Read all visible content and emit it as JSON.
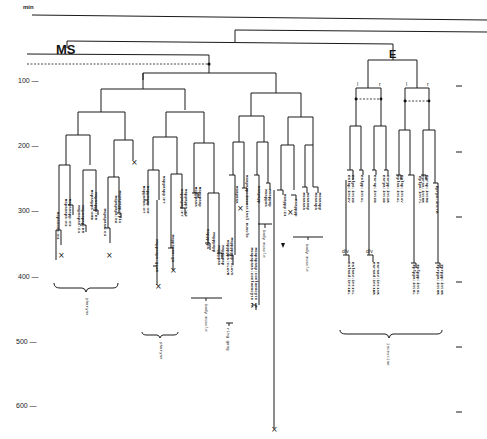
{
  "diagram": {
    "type": "cell-lineage-tree",
    "axis": {
      "unit_label": "min",
      "ticks": [
        {
          "t": 100,
          "label": "100 —"
        },
        {
          "t": 200,
          "label": "200 —"
        },
        {
          "t": 300,
          "label": "300 —"
        },
        {
          "t": 400,
          "label": "400 —"
        },
        {
          "t": 500,
          "label": "500 —"
        },
        {
          "t": 600,
          "label": "600 —"
        }
      ],
      "right_ticks": [
        100,
        200,
        300,
        400,
        500,
        600
      ]
    },
    "lineages": [
      {
        "id": "MS",
        "label": "MS"
      },
      {
        "id": "E",
        "label": "E"
      }
    ],
    "side_labels": [
      "l",
      "r",
      "l",
      "r"
    ],
    "div_labels": [
      "d/v",
      "d/v"
    ],
    "tissue_groups": [
      {
        "name": "pharynx",
        "label": "pharynx"
      },
      {
        "name": "pharynx",
        "label": "pharynx"
      },
      {
        "name": "body muscle",
        "label": "body muscle"
      },
      {
        "name": "ring gang",
        "label": "ring gang"
      },
      {
        "name": "body muscle",
        "label": "body muscle"
      },
      {
        "name": "body muscle",
        "label": "body muscle"
      },
      {
        "name": "intestine",
        "label": "intestine"
      }
    ],
    "cell_labels": [
      {
        "x": 57,
        "t": 345,
        "text": "MSpaaaaa:m4"
      },
      {
        "x": 65,
        "t": 325,
        "text": "MSpaaapa:m3"
      },
      {
        "x": 69,
        "t": 325,
        "text": "MSpaaapp:m3"
      },
      {
        "x": 78,
        "t": 335,
        "text": "MSpaapaa:I4"
      },
      {
        "x": 82,
        "t": 335,
        "text": "MSpaapap:m5"
      },
      {
        "x": 91,
        "t": 315,
        "text": "MSpaappa:m5D"
      },
      {
        "x": 95,
        "t": 315,
        "text": "MSpaappp:m5"
      },
      {
        "x": 104,
        "t": 340,
        "text": "MSpapaaa:e3"
      },
      {
        "x": 115,
        "t": 320,
        "text": "MSpapapa:m2"
      },
      {
        "x": 119,
        "t": 320,
        "text": "MSpapapp:vpi1"
      },
      {
        "x": 143,
        "t": 305,
        "text": "MSppaaaa:m7"
      },
      {
        "x": 147,
        "t": 305,
        "text": "MSppaaap:m6"
      },
      {
        "x": 156,
        "t": 395,
        "text": "MSppaapa:g1AR"
      },
      {
        "x": 163,
        "t": 290,
        "text": "MSppaapp:m7"
      },
      {
        "x": 172,
        "t": 380,
        "text": "MSppapaa:g2"
      },
      {
        "x": 181,
        "t": 310,
        "text": "MSppapap:m7"
      },
      {
        "x": 185,
        "t": 310,
        "text": "MSppappa:m2"
      },
      {
        "x": 195,
        "t": 295,
        "text": "MSpppaaa"
      },
      {
        "x": 199,
        "t": 295,
        "text": "MSpppaap"
      },
      {
        "x": 207,
        "t": 360,
        "text": "MSpppapa"
      },
      {
        "x": 213,
        "t": 365,
        "text": "MSpppapp"
      },
      {
        "x": 218,
        "t": 385,
        "text": "MSppppaa"
      },
      {
        "x": 222,
        "t": 385,
        "text": "MSppppap"
      },
      {
        "x": 227,
        "t": 400,
        "text": "MSpppppa:CLAVR"
      },
      {
        "x": 231,
        "t": 400,
        "text": "MSppppppp:CLAVS"
      },
      {
        "x": 236,
        "t": 290,
        "text": "MSapaaa"
      },
      {
        "x": 246,
        "t": 300,
        "text": "MSapaap:intestinal muscle"
      },
      {
        "x": 251,
        "t": 450,
        "text": "MSapapaaa:coelomocyte PR"
      },
      {
        "x": 255,
        "t": 450,
        "text": "MSapapaap:coelomocyte AR"
      },
      {
        "x": 258,
        "t": 290,
        "text": "MSapapp"
      },
      {
        "x": 265,
        "t": 295,
        "text": "MSappaa"
      },
      {
        "x": 269,
        "t": 295,
        "text": "MSappap"
      },
      {
        "x": 284,
        "t": 310,
        "text": "MSappp:Z1"
      },
      {
        "x": 295,
        "t": 310,
        "text": "MSapppp"
      },
      {
        "x": 303,
        "t": 300,
        "text": "MSaaaaa"
      },
      {
        "x": 307,
        "t": 300,
        "text": "MSaaaap"
      },
      {
        "x": 315,
        "t": 300,
        "text": "MSaaapa"
      },
      {
        "x": 319,
        "t": 300,
        "text": "MSaaapp"
      },
      {
        "x": 348,
        "t": 280,
        "text": "Ealap:int2V"
      },
      {
        "x": 352,
        "t": 280,
        "text": "Ealpa:int2D"
      },
      {
        "x": 361,
        "t": 280,
        "text": "Ealpp:int3L"
      },
      {
        "x": 348,
        "t": 430,
        "text": "Ealaad:int1DL"
      },
      {
        "x": 352,
        "t": 430,
        "text": "Ealaav:int1VL"
      },
      {
        "x": 373,
        "t": 430,
        "text": "Earaad:int1DR"
      },
      {
        "x": 377,
        "t": 430,
        "text": "Earaav:int1VR"
      },
      {
        "x": 374,
        "t": 280,
        "text": "Earap:int2D"
      },
      {
        "x": 383,
        "t": 280,
        "text": "Earpa:int3D"
      },
      {
        "x": 387,
        "t": 280,
        "text": "Earpp:int3R"
      },
      {
        "x": 397,
        "t": 285,
        "text": "Eplaa:int4L"
      },
      {
        "x": 401,
        "t": 285,
        "text": "Eplap:int4V"
      },
      {
        "x": 413,
        "t": 430,
        "text": "Eplppa:int8L"
      },
      {
        "x": 417,
        "t": 430,
        "text": "Eplppp:int9L"
      },
      {
        "x": 419,
        "t": 290,
        "text": "Eplpa:int7L"
      },
      {
        "x": 422,
        "t": 285,
        "text": "Epraa:int5R"
      },
      {
        "x": 426,
        "t": 285,
        "text": "Eprap:int5D"
      },
      {
        "x": 436,
        "t": 305,
        "text": "Eprpa:int7R"
      },
      {
        "x": 437,
        "t": 430,
        "text": "Eprppa:int8R"
      },
      {
        "x": 441,
        "t": 430,
        "text": "Eprppp:int9R"
      }
    ]
  }
}
